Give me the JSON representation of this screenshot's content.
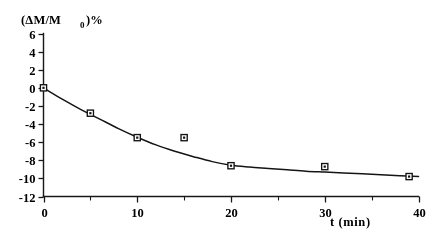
{
  "chart_data": {
    "type": "scatter",
    "title": "",
    "subtitle": "",
    "ylabel": "(ΔM/M",
    "ylabel_subscript": "0",
    "ylabel_suffix": " )%",
    "ylabel_full": "(ΔM/M₀ )%",
    "xlabel": "t (min)",
    "xlim": [
      0,
      40
    ],
    "ylim": [
      -12,
      6
    ],
    "xticks": [
      0,
      10,
      20,
      30,
      40
    ],
    "xticklabels": [
      "0",
      "10",
      "20",
      "30",
      "40"
    ],
    "xticks_minor": [
      5,
      15,
      25,
      35
    ],
    "yticks": [
      6,
      4,
      2,
      0,
      -2,
      -4,
      -6,
      -8,
      -10,
      -12
    ],
    "yticklabels": [
      "6",
      "4",
      "2",
      "0",
      "-2",
      "-4",
      "-6",
      "-8",
      "-10",
      "-12"
    ],
    "grid": false,
    "legend": false,
    "marker_style": "open-square",
    "line_color": "#161616",
    "marker_facecolor": "#ffffff",
    "marker_edgecolor": "#141414",
    "background": "#ffffff",
    "x": [
      0,
      5,
      10,
      15,
      20,
      30,
      39
    ],
    "values": [
      0.0,
      -2.8,
      -5.5,
      -5.5,
      -8.6,
      -8.7,
      -9.8
    ],
    "series": [
      {
        "name": "mass loss",
        "x": [
          0,
          5,
          10,
          15,
          20,
          30,
          39
        ],
        "values": [
          0.0,
          -2.8,
          -5.5,
          -5.5,
          -8.6,
          -8.7,
          -9.8
        ]
      }
    ],
    "fit_curve": {
      "name": "fitted decay curve",
      "x": [
        0,
        2,
        4,
        6,
        8,
        10,
        12,
        14,
        16,
        18,
        20,
        22,
        24,
        26,
        28,
        30,
        32,
        34,
        36,
        38,
        40
      ],
      "values": [
        0.0,
        -1.25,
        -2.4,
        -3.45,
        -4.5,
        -5.45,
        -6.3,
        -7.0,
        -7.6,
        -8.15,
        -8.55,
        -8.75,
        -8.9,
        -9.05,
        -9.2,
        -9.3,
        -9.4,
        -9.5,
        -9.6,
        -9.7,
        -9.8
      ]
    }
  }
}
